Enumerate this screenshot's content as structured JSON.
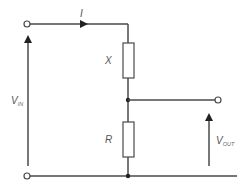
{
  "diagram": {
    "type": "circuit",
    "labels": {
      "current": "I",
      "top_resistor": "X",
      "bottom_resistor": "R",
      "vin_main": "V",
      "vin_sub": "IN",
      "vout_main": "V",
      "vout_sub": "OUT"
    },
    "colors": {
      "wire": "#4a4a4a",
      "text": "#555555",
      "background": "#ffffff"
    },
    "components": [
      {
        "id": "X",
        "kind": "resistor",
        "position": "top"
      },
      {
        "id": "R",
        "kind": "resistor",
        "position": "bottom"
      }
    ],
    "terminals": [
      "input-top",
      "input-bottom",
      "output"
    ]
  }
}
